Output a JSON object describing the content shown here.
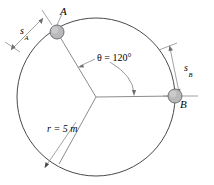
{
  "figure": {
    "type": "engineering-diagram",
    "canvas": {
      "width": 214,
      "height": 185
    },
    "colors": {
      "stroke": "#58585a",
      "circle_stroke": "#4a4a4c",
      "ball_fill": "#b9b9bb",
      "ball_stroke": "#6e6e70",
      "text": "#000000",
      "background": "#ffffff"
    },
    "circle": {
      "center_x": 96,
      "center_y": 97,
      "radius": 79,
      "radius_label": "r = 5 m",
      "radius_value": 5,
      "radius_units": "m"
    },
    "angle": {
      "symbol": "θ",
      "label": "θ = 120°",
      "value": 120,
      "units": "degrees"
    },
    "points": [
      {
        "id": "A",
        "label": "A",
        "x": 57,
        "y": 32,
        "r": 7
      },
      {
        "id": "B",
        "label": "B",
        "x": 175,
        "y": 96,
        "r": 7
      }
    ],
    "dimensions": [
      {
        "id": "sA",
        "symbol": "s",
        "subscript": "A",
        "label": "s_A"
      },
      {
        "id": "sB",
        "symbol": "s",
        "subscript": "B",
        "label": "s_B"
      }
    ],
    "labels": {
      "A": "A",
      "B": "B",
      "s": "s",
      "sub_A": "A",
      "sub_B": "B",
      "theta": "θ = 120°",
      "radius": "r = 5 m"
    }
  }
}
